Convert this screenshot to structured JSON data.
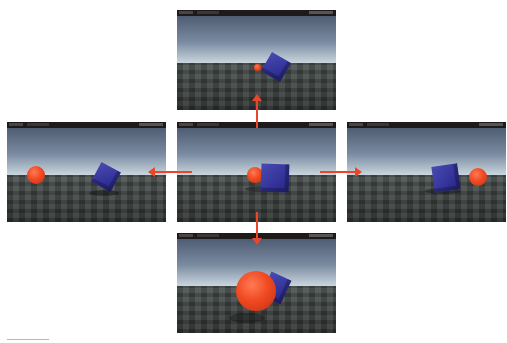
{
  "diagram": {
    "colors": {
      "arrow": "#e8472a",
      "sphere": "#f04a22",
      "cube": "#33339a",
      "toolbar": "#1e1a1a"
    },
    "panels": [
      {
        "id": "center",
        "label": "center-view",
        "objects": [
          "sphere-left-of-cube",
          "cube"
        ]
      },
      {
        "id": "top",
        "label": "view-moved-up",
        "objects": [
          "small-sphere",
          "rotated-cube"
        ]
      },
      {
        "id": "left",
        "label": "view-moved-left",
        "objects": [
          "sphere",
          "rotated-cube"
        ]
      },
      {
        "id": "right",
        "label": "view-moved-right",
        "objects": [
          "cube",
          "sphere"
        ]
      },
      {
        "id": "bottom",
        "label": "view-moved-down",
        "objects": [
          "large-sphere",
          "cube-behind"
        ]
      }
    ],
    "arrows": [
      "up",
      "down",
      "left",
      "right"
    ]
  }
}
